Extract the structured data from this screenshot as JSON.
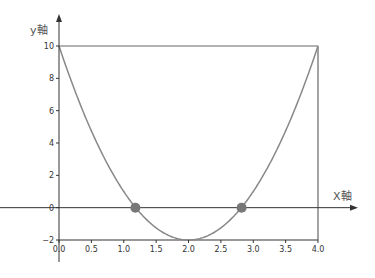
{
  "chart_data": {
    "type": "line",
    "title": "",
    "xlabel": "X軸",
    "ylabel": "y軸",
    "xlim": [
      0.0,
      4.0
    ],
    "ylim": [
      -2,
      10
    ],
    "grid": false,
    "x_ticks": [
      "0.0",
      "0.5",
      "1.0",
      "1.5",
      "2.0",
      "2.5",
      "3.0",
      "3.5",
      "4.0"
    ],
    "y_ticks": [
      "-2",
      "0",
      "2",
      "4",
      "6",
      "8",
      "10"
    ],
    "series": [
      {
        "name": "parabola y = 3(x-2)^2 - 2",
        "x": [
          0.0,
          0.5,
          1.0,
          1.5,
          2.0,
          2.5,
          3.0,
          3.5,
          4.0
        ],
        "y": [
          10,
          4.75,
          1,
          -1.25,
          -2,
          -1.25,
          1,
          4.75,
          10
        ]
      },
      {
        "name": "y = 10",
        "x": [
          0.0,
          4.0
        ],
        "y": [
          10,
          10
        ]
      },
      {
        "name": "x = 4",
        "x": [
          4.0,
          4.0
        ],
        "y": [
          -2,
          10
        ]
      }
    ],
    "points": [
      {
        "label": "root-1",
        "x": 1.18,
        "y": 0
      },
      {
        "label": "root-2",
        "x": 2.82,
        "y": 0
      }
    ],
    "colors": {
      "curve": "#888888",
      "axis": "#333333",
      "point": "#777777",
      "frame": "#666666"
    }
  }
}
